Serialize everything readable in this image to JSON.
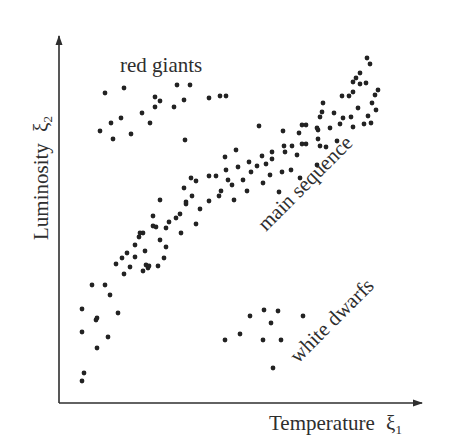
{
  "figure": {
    "x_axis_label": "Temperature",
    "x_axis_symbol": "ξ",
    "x_axis_subscript": "1",
    "y_axis_label": "Luminosity",
    "y_axis_symbol": "ξ",
    "y_axis_subscript": "2",
    "annotations": [
      {
        "text": "red giants",
        "x": 105,
        "y": 69,
        "rotate": 0
      },
      {
        "text": "main sequence",
        "x": 272,
        "y": 229,
        "rotate": -45
      },
      {
        "text": "white dwarfs",
        "x": 298,
        "y": 362,
        "rotate": -45
      }
    ],
    "colors": {
      "axis": "#2e2e2e",
      "dot": "#222222",
      "background": "#ffffff"
    }
  },
  "chart_data": {
    "type": "scatter",
    "title": "",
    "xlabel": "Temperature ξ1",
    "ylabel": "Luminosity ξ2",
    "xlim": [
      0,
      100
    ],
    "ylim": [
      0,
      100
    ],
    "grid": false,
    "legend": null,
    "ticks": "none",
    "axis_origin_px": [
      59,
      403
    ],
    "axis_end_px": [
      425,
      33
    ],
    "annotations": [
      "red giants",
      "main sequence",
      "white dwarfs"
    ],
    "series": [
      {
        "name": "red giants",
        "points_px": [
          [
            105,
            93
          ],
          [
            124,
            88
          ],
          [
            100,
            131
          ],
          [
            111,
            123
          ],
          [
            121,
            118
          ],
          [
            113,
            139
          ],
          [
            131,
            134
          ],
          [
            142,
            113
          ],
          [
            150,
            123
          ],
          [
            155,
            97
          ],
          [
            155,
            107
          ],
          [
            160,
            101
          ],
          [
            174,
            107
          ],
          [
            177,
            85
          ],
          [
            184,
            100
          ],
          [
            190,
            85
          ],
          [
            185,
            140
          ],
          [
            209,
            98
          ],
          [
            220,
            96
          ],
          [
            226,
            96
          ]
        ]
      },
      {
        "name": "main sequence",
        "points_px": [
          [
            82,
            381
          ],
          [
            84,
            373
          ],
          [
            82,
            332
          ],
          [
            97,
            348
          ],
          [
            108,
            337
          ],
          [
            82,
            309
          ],
          [
            96,
            320
          ],
          [
            97,
            318
          ],
          [
            92,
            285
          ],
          [
            118,
            313
          ],
          [
            110,
            295
          ],
          [
            124,
            274
          ],
          [
            105,
            285
          ],
          [
            116,
            264
          ],
          [
            122,
            258
          ],
          [
            127,
            253
          ],
          [
            130,
            267
          ],
          [
            135,
            245
          ],
          [
            139,
            237
          ],
          [
            143,
            271
          ],
          [
            145,
            251
          ],
          [
            148,
            268
          ],
          [
            143,
            233
          ],
          [
            153,
            216
          ],
          [
            156,
            227
          ],
          [
            164,
            258
          ],
          [
            160,
            240
          ],
          [
            146,
            265
          ],
          [
            135,
            257
          ],
          [
            140,
            233
          ],
          [
            149,
            266
          ],
          [
            153,
            226
          ],
          [
            158,
            266
          ],
          [
            166,
            247
          ],
          [
            166,
            228
          ],
          [
            160,
            200
          ],
          [
            169,
            222
          ],
          [
            176,
            218
          ],
          [
            180,
            214
          ],
          [
            186,
            202
          ],
          [
            192,
            196
          ],
          [
            181,
            233
          ],
          [
            186,
            204
          ],
          [
            184,
            188
          ],
          [
            191,
            178
          ],
          [
            196,
            181
          ],
          [
            200,
            209
          ],
          [
            196,
            224
          ],
          [
            209,
            176
          ],
          [
            209,
            201
          ],
          [
            219,
            196
          ],
          [
            216,
            176
          ],
          [
            221,
            191
          ],
          [
            226,
            170
          ],
          [
            228,
            180
          ],
          [
            225,
            157
          ],
          [
            236,
            150
          ],
          [
            234,
            200
          ],
          [
            238,
            167
          ],
          [
            243,
            180
          ],
          [
            251,
            172
          ],
          [
            257,
            166
          ],
          [
            249,
            162
          ],
          [
            262,
            156
          ],
          [
            266,
            164
          ],
          [
            272,
            159
          ],
          [
            272,
            152
          ],
          [
            247,
            191
          ],
          [
            263,
            183
          ],
          [
            270,
            175
          ],
          [
            282,
            172
          ],
          [
            284,
            146
          ],
          [
            285,
            152
          ],
          [
            283,
            131
          ],
          [
            292,
            146
          ],
          [
            297,
            155
          ],
          [
            299,
            133
          ],
          [
            302,
            144
          ],
          [
            306,
            144
          ],
          [
            291,
            170
          ],
          [
            300,
            178
          ],
          [
            317,
            165
          ],
          [
            232,
            185
          ],
          [
            279,
            192
          ],
          [
            259,
            126
          ],
          [
            302,
            125
          ],
          [
            318,
            130
          ],
          [
            306,
            125
          ],
          [
            317,
            128
          ],
          [
            323,
            103
          ],
          [
            322,
            112
          ],
          [
            318,
            139
          ],
          [
            326,
            147
          ],
          [
            320,
            146
          ],
          [
            337,
            141
          ],
          [
            340,
            124
          ],
          [
            351,
            117
          ],
          [
            358,
            108
          ],
          [
            334,
            113
          ],
          [
            320,
            117
          ],
          [
            349,
            96
          ],
          [
            342,
            96
          ],
          [
            353,
            92
          ],
          [
            353,
            82
          ],
          [
            360,
            84
          ],
          [
            356,
            78
          ],
          [
            367,
            58
          ],
          [
            360,
            73
          ],
          [
            366,
            83
          ],
          [
            370,
            64
          ],
          [
            375,
            95
          ],
          [
            376,
            110
          ],
          [
            378,
            90
          ],
          [
            372,
            103
          ],
          [
            368,
            116
          ],
          [
            371,
            123
          ],
          [
            364,
            124
          ],
          [
            353,
            127
          ],
          [
            343,
            118
          ],
          [
            330,
            128
          ]
        ]
      },
      {
        "name": "white dwarfs",
        "points_px": [
          [
            225,
            340
          ],
          [
            240,
            334
          ],
          [
            250,
            316
          ],
          [
            264,
            310
          ],
          [
            271,
            323
          ],
          [
            263,
            340
          ],
          [
            281,
            340
          ],
          [
            278,
            311
          ],
          [
            273,
            368
          ],
          [
            303,
            316
          ]
        ]
      }
    ]
  }
}
